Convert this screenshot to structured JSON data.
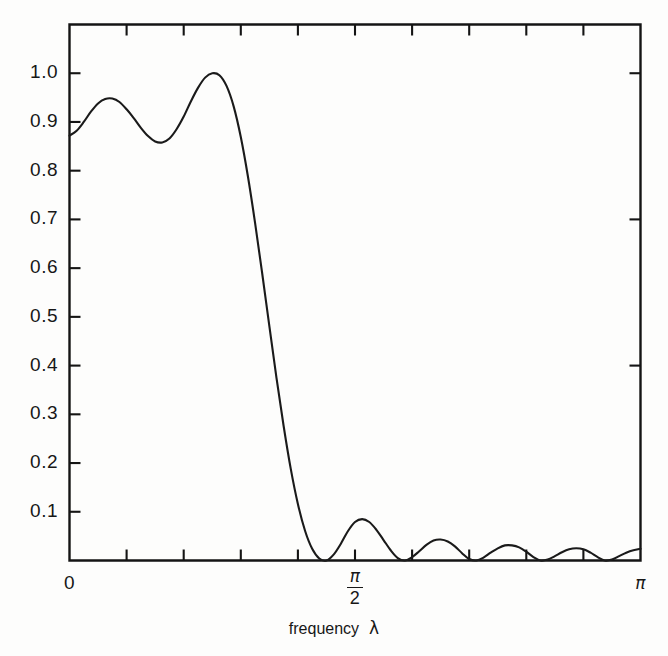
{
  "figure": {
    "background_color": "#fdfdfc",
    "line_color": "#1a1a1a",
    "axis_color": "#141414"
  },
  "axes": {
    "x_label_prefix": "frequency",
    "x_label_symbol": "λ",
    "x_tick_labels": [
      "0",
      "π/2",
      "π"
    ],
    "x_tick_zero": "0",
    "x_tick_half_num": "π",
    "x_tick_half_den": "2",
    "x_tick_pi": "π",
    "y_tick_labels": [
      "0.1",
      "0.2",
      "0.3",
      "0.4",
      "0.5",
      "0.6",
      "0.7",
      "0.8",
      "0.9",
      "1.0"
    ]
  },
  "chart_data": {
    "type": "line",
    "title": "",
    "subtitle": "",
    "xlabel": "frequency  λ",
    "ylabel": "",
    "xlim": [
      0,
      3.14159265
    ],
    "ylim": [
      0,
      1.1
    ],
    "x_ticks": [
      0,
      0.3141593,
      0.6283185,
      0.9424778,
      1.2566371,
      1.5707963,
      1.8849556,
      2.1991149,
      2.5132741,
      2.8274334,
      3.1415927
    ],
    "x_tick_text": [
      "0",
      "",
      "",
      "",
      "",
      "π/2",
      "",
      "",
      "",
      "",
      "π"
    ],
    "y_ticks": [
      0.1,
      0.2,
      0.3,
      0.4,
      0.5,
      0.6,
      0.7,
      0.8,
      0.9,
      1.0
    ],
    "grid": false,
    "legend": null,
    "legend_position": "none",
    "series": [
      {
        "name": "magnitude response",
        "x": [
          0.0,
          0.0393,
          0.0785,
          0.1178,
          0.1571,
          0.1963,
          0.2356,
          0.2749,
          0.3142,
          0.3534,
          0.3927,
          0.432,
          0.4712,
          0.5105,
          0.5498,
          0.589,
          0.6283,
          0.6676,
          0.7069,
          0.7461,
          0.7854,
          0.8247,
          0.8639,
          0.9032,
          0.9425,
          0.9817,
          1.021,
          1.0603,
          1.0996,
          1.1388,
          1.1781,
          1.2174,
          1.2566,
          1.2959,
          1.3352,
          1.3744,
          1.4137,
          1.453,
          1.4923,
          1.5315,
          1.5708,
          1.6101,
          1.6493,
          1.6886,
          1.7279,
          1.7671,
          1.8064,
          1.8457,
          1.885,
          1.9242,
          1.9635,
          2.0028,
          2.042,
          2.0813,
          2.1206,
          2.1598,
          2.1991,
          2.2384,
          2.2777,
          2.3169,
          2.3562,
          2.3955,
          2.4347,
          2.474,
          2.5133,
          2.5525,
          2.5918,
          2.6311,
          2.6704,
          2.7096,
          2.7489,
          2.7882,
          2.8274,
          2.8667,
          2.906,
          2.9452,
          2.9845,
          3.0238,
          3.0631,
          3.1023,
          3.1416
        ],
        "y": [
          0.872,
          0.882,
          0.9,
          0.921,
          0.938,
          0.947,
          0.948,
          0.941,
          0.926,
          0.908,
          0.888,
          0.871,
          0.86,
          0.858,
          0.866,
          0.885,
          0.911,
          0.942,
          0.97,
          0.991,
          1.0,
          0.996,
          0.974,
          0.932,
          0.869,
          0.788,
          0.693,
          0.589,
          0.481,
          0.375,
          0.276,
          0.188,
          0.116,
          0.061,
          0.024,
          0.004,
          0.0,
          0.012,
          0.034,
          0.06,
          0.079,
          0.085,
          0.079,
          0.063,
          0.042,
          0.021,
          0.005,
          0.0,
          0.007,
          0.019,
          0.032,
          0.041,
          0.043,
          0.039,
          0.029,
          0.015,
          0.003,
          0.0,
          0.006,
          0.016,
          0.025,
          0.031,
          0.031,
          0.027,
          0.018,
          0.007,
          0.0,
          0.002,
          0.009,
          0.017,
          0.023,
          0.025,
          0.023,
          0.016,
          0.007,
          0.0,
          0.002,
          0.009,
          0.016,
          0.021,
          0.024
        ]
      }
    ],
    "annotations": [
      {
        "text": "passband ripple peak",
        "x": 0.7854,
        "y": 1.0
      },
      {
        "text": "first stopband null",
        "x": 1.4137,
        "y": 0.0
      }
    ]
  }
}
